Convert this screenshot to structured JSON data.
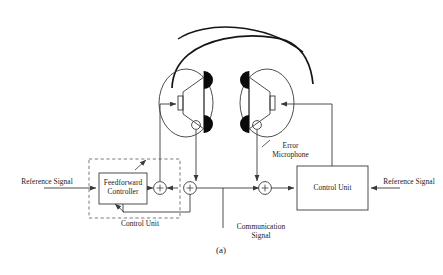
{
  "figure": {
    "caption": "(a)",
    "type": "anc-headphone-block-diagram"
  },
  "labels": {
    "reference_signal_left": "Reference Signal",
    "reference_signal_right": "Reference Signal",
    "feedforward_controller": "Feedforward\nController",
    "control_unit_dashed": "Control Unit",
    "control_unit_block": "Control Unit",
    "error_microphone": "Error\nMicrophone",
    "communication_signal": "Communication\nSignal"
  },
  "summing_junctions": [
    {
      "name": "sum-1",
      "sign": "+"
    },
    {
      "name": "sum-2",
      "sign": "+"
    },
    {
      "name": "sum-3",
      "sign": "+"
    }
  ],
  "colors": {
    "line": "#3a3a3a",
    "ink": "#1b1b1b",
    "pad": "#0a0a0a",
    "background": "#ffffff"
  }
}
